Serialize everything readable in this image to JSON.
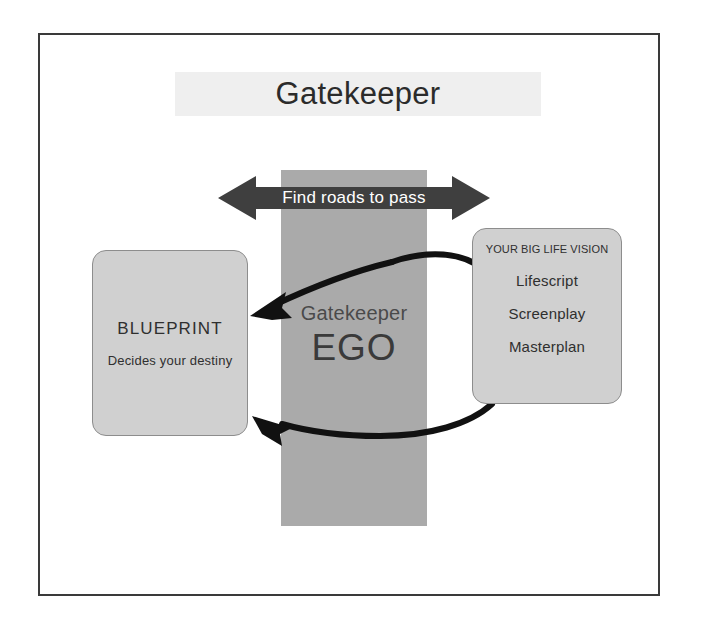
{
  "diagram": {
    "title": "Gatekeeper",
    "frame": {
      "border_color": "#3a3a3a",
      "background": "#ffffff"
    },
    "center_column": {
      "label_small": "Gatekeeper",
      "label_large": "EGO",
      "fill_color": "#aaaaaa"
    },
    "top_arrow": {
      "label": "Find roads to pass",
      "type": "double-headed-arrow",
      "fill_color": "#3f3f3f",
      "label_color": "#ffffff"
    },
    "blueprint_box": {
      "title": "BLUEPRINT",
      "subtitle": "Decides your destiny",
      "fill_color": "#d0d0d0",
      "border_color": "#8d8d8d"
    },
    "vision_box": {
      "title": "YOUR BIG LIFE VISION",
      "items": [
        "Lifescript",
        "Screenplay",
        "Masterplan"
      ],
      "fill_color": "#d0d0d0",
      "border_color": "#8d8d8d"
    },
    "connectors": [
      {
        "name": "upper-curved-arrow",
        "from": "vision_box",
        "to": "blueprint_box",
        "color": "#111111"
      },
      {
        "name": "lower-curved-arrow",
        "from": "vision_box",
        "to": "blueprint_box",
        "color": "#111111"
      }
    ]
  }
}
